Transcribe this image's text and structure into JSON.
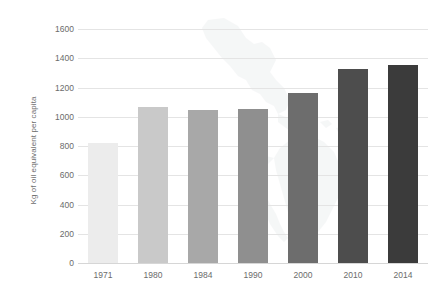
{
  "chart_data": {
    "type": "bar",
    "title": "",
    "subtitle": "",
    "xlabel": "",
    "ylabel": "Kg of oil equivalent per capita",
    "categories": [
      "1971",
      "1980",
      "1984",
      "1990",
      "2000",
      "2010",
      "2014"
    ],
    "values": [
      820,
      1065,
      1045,
      1050,
      1160,
      1330,
      1355
    ],
    "series": [
      {
        "name": "Energy use per capita",
        "values": [
          820,
          1065,
          1045,
          1050,
          1160,
          1330,
          1355
        ]
      }
    ],
    "ylim": [
      0,
      1600
    ],
    "ytick_step": 200,
    "yticks": [
      0,
      200,
      400,
      600,
      800,
      1000,
      1200,
      1400,
      1600
    ],
    "ytick_labels": [
      "0",
      "200",
      "400",
      "600",
      "800",
      "1000",
      "1200",
      "1400",
      "1600"
    ],
    "grid": true,
    "grid_axis": "y",
    "legend": false,
    "legend_position": "none",
    "bar_colors": [
      "#ececec",
      "#c9c9c9",
      "#a8a8a8",
      "#8f8f8f",
      "#6d6d6d",
      "#4d4d4d",
      "#3b3b3b"
    ],
    "annotations": [],
    "background": {
      "watermark": "world-map-americas-outline",
      "watermark_color": "#9aa6ad"
    }
  },
  "style": {
    "gridline_color": "#e4e4e4",
    "baseline_color": "#d6d6d6",
    "tick_text_color": "#6b6b6b",
    "axis_title_color": "#6e6e6e",
    "plot_background": "#ffffff"
  }
}
